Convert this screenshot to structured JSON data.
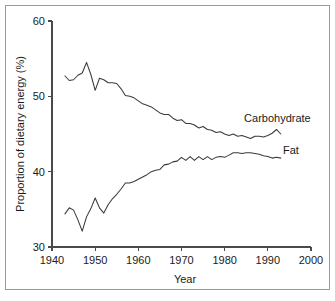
{
  "figure": {
    "background_color": "#ffffff",
    "border_color": "#9a9a9a",
    "line_color": "#3a3a3a",
    "text_color": "#1a1a1a"
  },
  "chart_data": {
    "type": "line",
    "title": "",
    "subtitle": "",
    "xlabel": "Year",
    "ylabel": "Proportion of dietary energy (%)",
    "xlim": [
      1940,
      2000
    ],
    "ylim": [
      30,
      60
    ],
    "xticks": [
      1940,
      1950,
      1960,
      1970,
      1980,
      1990,
      2000
    ],
    "xtick_labels": [
      "1940",
      "1950",
      "1960",
      "1970",
      "1980",
      "1990",
      "2000"
    ],
    "yticks": [
      30,
      40,
      50,
      60
    ],
    "ytick_labels": [
      "30",
      "40",
      "50",
      "60"
    ],
    "grid": false,
    "legend_position": "inline-end-of-line",
    "annotations": [
      {
        "text": "Carbohydrate",
        "x": 1984.5,
        "y": 46.6
      },
      {
        "text": "Fat",
        "x": 1993.5,
        "y": 42.4
      }
    ],
    "x": [
      1943,
      1944,
      1945,
      1946,
      1947,
      1948,
      1949,
      1950,
      1951,
      1952,
      1953,
      1954,
      1955,
      1956,
      1957,
      1958,
      1959,
      1960,
      1961,
      1962,
      1963,
      1964,
      1965,
      1966,
      1967,
      1968,
      1969,
      1970,
      1971,
      1972,
      1973,
      1974,
      1975,
      1976,
      1977,
      1978,
      1979,
      1980,
      1981,
      1982,
      1983,
      1984,
      1985,
      1986,
      1987,
      1988,
      1989,
      1990,
      1991,
      1992,
      1993
    ],
    "series": [
      {
        "name": "Carbohydrate",
        "values": [
          52.7,
          52.1,
          52.2,
          52.8,
          53.1,
          54.5,
          52.9,
          50.8,
          52.4,
          52.2,
          51.8,
          51.8,
          51.7,
          51.0,
          50.1,
          50.0,
          49.8,
          49.4,
          49.0,
          48.8,
          48.6,
          48.2,
          47.8,
          47.6,
          47.6,
          47.1,
          46.8,
          46.9,
          46.4,
          46.4,
          46.2,
          45.8,
          46.0,
          45.6,
          45.5,
          45.2,
          45.3,
          45.0,
          44.8,
          45.0,
          44.7,
          44.8,
          44.6,
          44.4,
          44.7,
          44.7,
          44.6,
          44.8,
          45.1,
          45.6,
          45.0
        ]
      },
      {
        "name": "Fat",
        "values": [
          34.4,
          35.2,
          34.9,
          33.6,
          32.1,
          34.0,
          35.1,
          36.5,
          35.2,
          34.5,
          35.6,
          36.4,
          37.0,
          37.7,
          38.5,
          38.5,
          38.7,
          39.0,
          39.3,
          39.6,
          40.0,
          40.2,
          40.3,
          40.9,
          41.0,
          41.3,
          41.4,
          41.9,
          41.5,
          42.0,
          41.5,
          42.0,
          41.6,
          42.0,
          41.6,
          41.9,
          42.0,
          41.9,
          42.2,
          42.5,
          42.5,
          42.4,
          42.5,
          42.5,
          42.4,
          42.3,
          42.1,
          42.0,
          41.8,
          41.9,
          41.8
        ]
      }
    ]
  }
}
